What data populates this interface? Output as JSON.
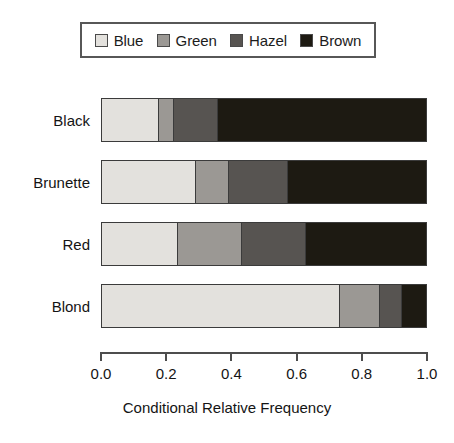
{
  "chart_data": {
    "type": "bar",
    "orientation": "horizontal",
    "stacked": true,
    "normalized": true,
    "title": "",
    "xlabel": "Conditional Relative Frequency",
    "ylabel": "",
    "xlim": [
      0.0,
      1.0
    ],
    "xticks": [
      "0.0",
      "0.2",
      "0.4",
      "0.6",
      "0.8",
      "1.0"
    ],
    "xtick_values": [
      0.0,
      0.2,
      0.4,
      0.6,
      0.8,
      1.0
    ],
    "grid": false,
    "legend_position": "top",
    "categories": [
      "Black",
      "Brunette",
      "Red",
      "Blond"
    ],
    "series": [
      {
        "name": "Blue",
        "color": "#e3e1dd",
        "values": [
          0.172,
          0.288,
          0.233,
          0.73
        ]
      },
      {
        "name": "Green",
        "color": "#9b9894",
        "values": [
          0.046,
          0.101,
          0.196,
          0.126
        ]
      },
      {
        "name": "Hazel",
        "color": "#575451",
        "values": [
          0.138,
          0.181,
          0.199,
          0.067
        ]
      },
      {
        "name": "Brown",
        "color": "#1d1a12",
        "values": [
          0.644,
          0.43,
          0.372,
          0.077
        ]
      }
    ]
  },
  "legend": {
    "items": [
      {
        "label": "Blue",
        "color": "#e3e1dd"
      },
      {
        "label": "Green",
        "color": "#9b9894"
      },
      {
        "label": "Hazel",
        "color": "#575451"
      },
      {
        "label": "Brown",
        "color": "#1d1a12"
      }
    ]
  },
  "axis": {
    "x_title": "Conditional Relative Frequency",
    "tick_labels": [
      "0.0",
      "0.2",
      "0.4",
      "0.6",
      "0.8",
      "1.0"
    ]
  },
  "categories": [
    "Black",
    "Brunette",
    "Red",
    "Blond"
  ]
}
